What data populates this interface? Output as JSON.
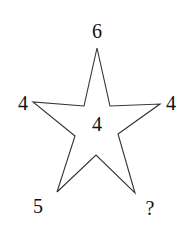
{
  "diagram": {
    "type": "number-star-puzzle",
    "shape": "five-pointed star",
    "labels": {
      "top": "6",
      "left": "4",
      "right": "4",
      "center": "4",
      "bottom_left": "5",
      "bottom_right": "?"
    },
    "colors": {
      "stroke": "#333333",
      "fill": "#ffffff",
      "text": "#111111"
    }
  }
}
